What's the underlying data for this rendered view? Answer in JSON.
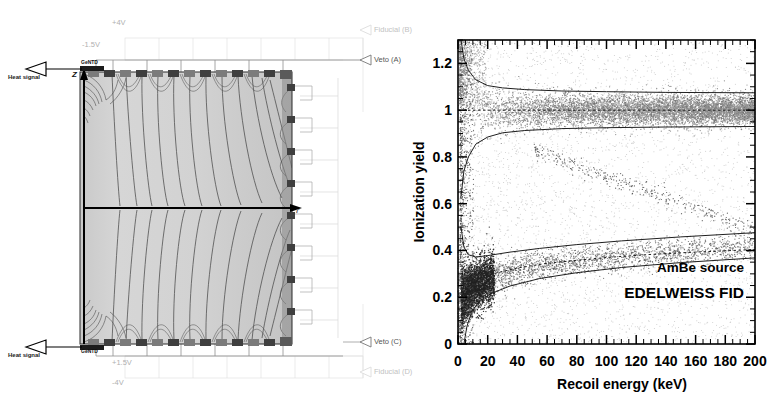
{
  "figure": {
    "panels": [
      "detector-schematic",
      "ionization-yield-scatter"
    ]
  },
  "detector": {
    "title": "EDELWEISS FID detector field-line schematic",
    "labels": {
      "top_voltage_outer": "+4V",
      "top_voltage_inner": "-1.5V",
      "bottom_voltage_inner": "+1.5V",
      "bottom_voltage_outer": "-4V",
      "electrode_fiducial_b": "Fiducial (B)",
      "electrode_veto_a": "Veto (A)",
      "electrode_veto_c": "Veto (C)",
      "electrode_fiducial_d": "Fiducial (D)",
      "heat_signal_top": "Heat signal",
      "heat_signal_bottom": "Heat signal",
      "ntd_top": "GeNTD",
      "ntd_bottom": "GeNTD",
      "axis_z": "Z",
      "axis_r": "r"
    },
    "electrode_marks": {
      "veto": "A",
      "fiducial": "B"
    }
  },
  "chart_data": {
    "type": "scatter",
    "title": "",
    "xlabel": "Recoil energy (keV)",
    "ylabel": "Ionization yield",
    "xlim": [
      0,
      200
    ],
    "ylim": [
      0,
      1.3
    ],
    "xticks": [
      0,
      20,
      40,
      60,
      80,
      100,
      120,
      140,
      160,
      180,
      200
    ],
    "xticklabels": [
      "0",
      "20",
      "40",
      "60",
      "80",
      "100",
      "120",
      "140",
      "160",
      "180",
      "200"
    ],
    "yticks": [
      0,
      0.2,
      0.4,
      0.6,
      0.8,
      1.0,
      1.2
    ],
    "yticklabels": [
      "0",
      "0.2",
      "0.4",
      "0.6",
      "0.8",
      "1",
      "1.2"
    ],
    "grid": false,
    "legend": "none",
    "annotations": [
      {
        "text": "AmBe source",
        "x": 150,
        "y": 0.25
      },
      {
        "text": "EDELWEISS FID",
        "x": 140,
        "y": 0.17
      }
    ],
    "series": [
      {
        "name": "electron recoil band centre",
        "kind": "line",
        "style": "dotted",
        "points": [
          [
            0,
            1.0
          ],
          [
            200,
            1.0
          ]
        ]
      },
      {
        "name": "electron recoil band upper 90% limit",
        "kind": "line",
        "style": "solid",
        "points": [
          [
            2,
            1.3
          ],
          [
            4,
            1.22
          ],
          [
            7,
            1.17
          ],
          [
            12,
            1.13
          ],
          [
            20,
            1.105
          ],
          [
            30,
            1.095
          ],
          [
            45,
            1.088
          ],
          [
            70,
            1.082
          ],
          [
            100,
            1.079
          ],
          [
            140,
            1.076
          ],
          [
            200,
            1.074
          ]
        ]
      },
      {
        "name": "electron recoil band lower 90% limit",
        "kind": "line",
        "style": "solid",
        "points": [
          [
            2,
            0.63
          ],
          [
            4,
            0.74
          ],
          [
            7,
            0.8
          ],
          [
            12,
            0.855
          ],
          [
            20,
            0.885
          ],
          [
            30,
            0.903
          ],
          [
            45,
            0.913
          ],
          [
            70,
            0.921
          ],
          [
            100,
            0.925
          ],
          [
            140,
            0.928
          ],
          [
            200,
            0.93
          ]
        ]
      },
      {
        "name": "nuclear recoil band centre",
        "kind": "line",
        "style": "dotted",
        "points": [
          [
            3,
            0.215
          ],
          [
            6,
            0.247
          ],
          [
            10,
            0.268
          ],
          [
            20,
            0.295
          ],
          [
            40,
            0.325
          ],
          [
            60,
            0.345
          ],
          [
            80,
            0.358
          ],
          [
            100,
            0.37
          ],
          [
            130,
            0.383
          ],
          [
            160,
            0.393
          ],
          [
            200,
            0.404
          ]
        ]
      },
      {
        "name": "nuclear recoil band upper 90% limit",
        "kind": "line",
        "style": "solid",
        "points": [
          [
            2,
            0.5
          ],
          [
            4,
            0.415
          ],
          [
            7,
            0.382
          ],
          [
            12,
            0.372
          ],
          [
            20,
            0.378
          ],
          [
            35,
            0.393
          ],
          [
            55,
            0.409
          ],
          [
            80,
            0.425
          ],
          [
            110,
            0.441
          ],
          [
            150,
            0.458
          ],
          [
            200,
            0.476
          ]
        ]
      },
      {
        "name": "nuclear recoil band lower 90% limit",
        "kind": "line",
        "style": "solid",
        "points": [
          [
            4,
            0.0
          ],
          [
            6,
            0.075
          ],
          [
            9,
            0.135
          ],
          [
            14,
            0.18
          ],
          [
            22,
            0.215
          ],
          [
            35,
            0.248
          ],
          [
            55,
            0.28
          ],
          [
            80,
            0.305
          ],
          [
            110,
            0.327
          ],
          [
            150,
            0.348
          ],
          [
            200,
            0.368
          ]
        ]
      },
      {
        "name": "gamma / neutron event population",
        "kind": "points",
        "description": "dense electron-recoil band near Q=1, nuclear-recoil band near Q=0.3, and a low-energy high-density cluster below 25 keV"
      },
      {
        "name": "inelastic scatter line",
        "kind": "points",
        "description": "diagonal sparse band descending from ~ (55 keV, 0.80) to ~ (200 keV, 0.50)"
      }
    ]
  }
}
